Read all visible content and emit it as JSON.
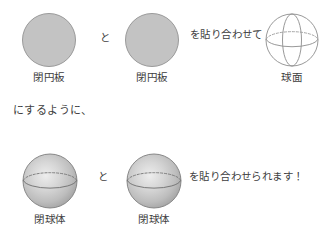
{
  "figure": {
    "type": "math-illustration",
    "background_color": "#ffffff",
    "text_color": "#404040",
    "rows": [
      {
        "id": "row-top",
        "shapes": [
          {
            "id": "disk-left",
            "kind": "closed-disk",
            "caption": "閉円板",
            "fill_color": "#c3c3c3",
            "stroke_color": "#9a9a9a"
          },
          {
            "id": "disk-right",
            "kind": "closed-disk",
            "caption": "閉円板",
            "fill_color": "#c3c3c3",
            "stroke_color": "#9a9a9a"
          },
          {
            "id": "sphere-surface",
            "kind": "sphere-surface-wireframe",
            "caption": "球面",
            "fill_color": "#ffffff",
            "stroke_color": "#8d8d8d"
          }
        ],
        "connector": "と",
        "phrase": "を貼り合わせて"
      },
      {
        "id": "row-bottom",
        "shapes": [
          {
            "id": "ball-left",
            "kind": "closed-ball-shaded",
            "caption": "閉球体",
            "fill_color": "#b9b9b9",
            "highlight_color": "#ededed",
            "stroke_color": "#7e7e7e"
          },
          {
            "id": "ball-right",
            "kind": "closed-ball-shaded",
            "caption": "閉球体",
            "fill_color": "#b9b9b9",
            "highlight_color": "#ededed",
            "stroke_color": "#7e7e7e"
          }
        ],
        "connector": "と",
        "phrase": "を貼り合わせられます！"
      }
    ],
    "middle_sentence": "にするように、"
  }
}
